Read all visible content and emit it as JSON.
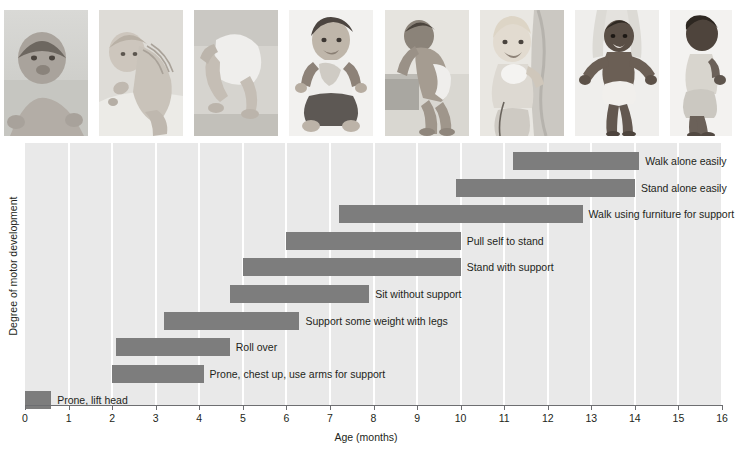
{
  "figure": {
    "x_axis_title": "Age (months)",
    "y_axis_title": "Degree of motor development"
  },
  "photos": [
    {
      "name": "photo-prone-lift-head",
      "alt": "Baby lying prone lifting head"
    },
    {
      "name": "photo-roll-over",
      "alt": "Baby rolling over"
    },
    {
      "name": "photo-support-weight",
      "alt": "Baby supporting weight on legs"
    },
    {
      "name": "photo-sit-without-support",
      "alt": "Baby sitting without support"
    },
    {
      "name": "photo-pull-self-to-stand",
      "alt": "Baby pulling self to stand at a bench"
    },
    {
      "name": "photo-stand-with-support",
      "alt": "Baby standing holding support"
    },
    {
      "name": "photo-walk-with-help",
      "alt": "Baby walking held by adult hands"
    },
    {
      "name": "photo-walk-alone",
      "alt": "Toddler walking alone"
    }
  ],
  "chart_data": {
    "type": "bar",
    "orientation": "horizontal",
    "subtype": "range-bar",
    "title": "",
    "xlabel": "Age (months)",
    "ylabel": "Degree of motor development",
    "xlim": [
      0,
      16
    ],
    "xticks": [
      0,
      1,
      2,
      3,
      4,
      5,
      6,
      7,
      8,
      9,
      10,
      11,
      12,
      13,
      14,
      15,
      16
    ],
    "xtick_labels": [
      "0",
      "1",
      "2",
      "3",
      "4",
      "5",
      "6",
      "7",
      "8",
      "9",
      "10",
      "11",
      "12",
      "13",
      "14",
      "15",
      "16"
    ],
    "grid": "vertical-white-gridlines",
    "legend": "none",
    "bar_color": "#7d7d7d",
    "plot_background": "#e9e9e9",
    "categories": [
      "Walk alone easily",
      "Stand alone easily",
      "Walk using furniture for support",
      "Pull self to stand",
      "Stand with support",
      "Sit without support",
      "Support some weight with legs",
      "Roll over",
      "Prone, chest up, use arms for support",
      "Prone, lift head"
    ],
    "ranges": [
      {
        "label": "Walk alone easily",
        "start": 11.2,
        "end": 14.1
      },
      {
        "label": "Stand alone easily",
        "start": 9.9,
        "end": 14.0
      },
      {
        "label": "Walk using furniture for support",
        "start": 7.2,
        "end": 12.8
      },
      {
        "label": "Pull self to stand",
        "start": 6.0,
        "end": 10.0
      },
      {
        "label": "Stand with support",
        "start": 5.0,
        "end": 10.0
      },
      {
        "label": "Sit without support",
        "start": 4.7,
        "end": 7.9
      },
      {
        "label": "Support some weight with legs",
        "start": 3.2,
        "end": 6.3
      },
      {
        "label": "Roll over",
        "start": 2.1,
        "end": 4.7
      },
      {
        "label": "Prone, chest up, use arms for support",
        "start": 2.0,
        "end": 4.1
      },
      {
        "label": "Prone, lift head",
        "start": 0.0,
        "end": 0.6
      }
    ]
  }
}
